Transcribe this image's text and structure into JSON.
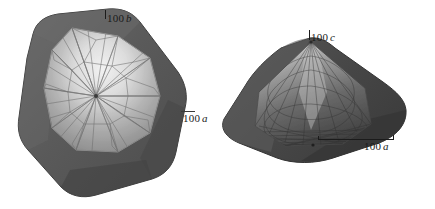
{
  "figure": {
    "background_color": "#ffffff",
    "panels": [
      {
        "id": "left",
        "name": "crystal-model-left",
        "description": "Blocky near-equant polyhedral crystal habit shown as a dark outer shell with a lighter triangulated wireframe mesh surface inside",
        "shell_color": "#5d5d5d",
        "surface_light_color": "#e8e8e8",
        "surface_dark_color": "#8f8f8f",
        "mesh_color": "#6b6b6b",
        "labels": [
          {
            "id": "b",
            "number": "100",
            "symbol": "b",
            "axis": "b",
            "orientation": "vertical",
            "tick": "vertical"
          },
          {
            "id": "a1",
            "number": "100",
            "symbol": "a",
            "axis": "a",
            "orientation": "horizontal",
            "tick": "horizontal"
          }
        ]
      },
      {
        "id": "right",
        "name": "crystal-model-right",
        "description": "Flattened lens / low dome shaped crystal habit shown as a dark shell with faint wireframe mesh, viewed nearly edge-on",
        "shell_color": "#4a4a4a",
        "surface_light_color": "#c9c9c9",
        "surface_dark_color": "#3c3c3c",
        "mesh_color": "#2e2e2e",
        "labels": [
          {
            "id": "c",
            "number": "100",
            "symbol": "c",
            "axis": "c",
            "orientation": "vertical",
            "tick": "vertical"
          },
          {
            "id": "a2",
            "number": "100",
            "symbol": "a",
            "axis": "a",
            "orientation": "horizontal",
            "tick": "scale-bar"
          }
        ]
      }
    ]
  },
  "labels": {
    "left_b": {
      "number": "100",
      "symbol": "b"
    },
    "left_a": {
      "number": "100",
      "symbol": "a"
    },
    "right_c": {
      "number": "100",
      "symbol": "c"
    },
    "right_a": {
      "number": "100",
      "symbol": "a"
    }
  },
  "colors": {
    "background": "#ffffff",
    "text": "#1a1a1a",
    "tick": "#1b1b1b"
  }
}
